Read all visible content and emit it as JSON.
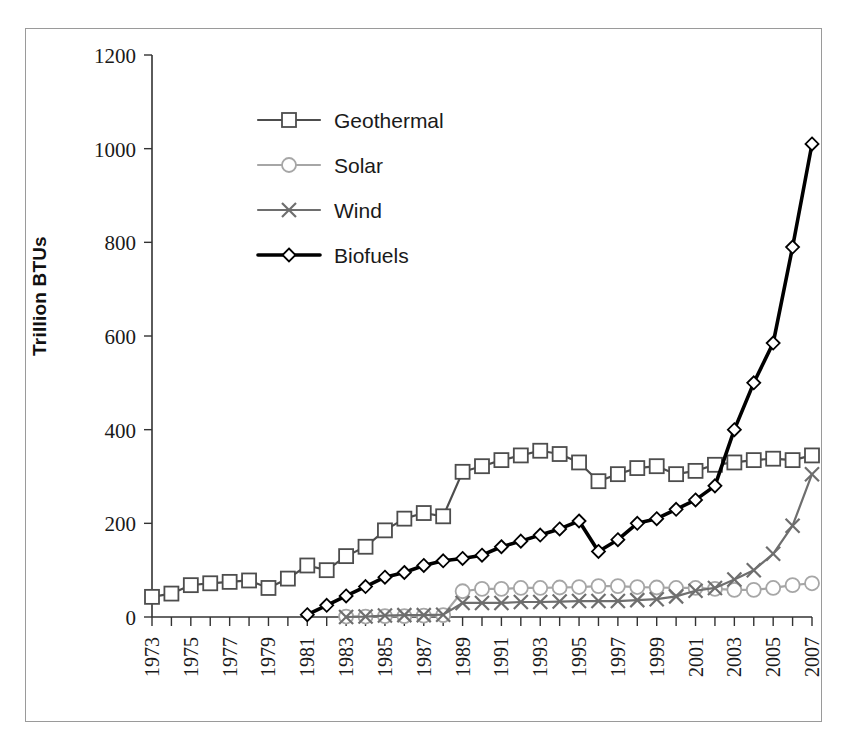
{
  "chart_data": {
    "type": "line",
    "title": "",
    "subtitle": "",
    "xlabel": "",
    "ylabel": "Trillion BTUs",
    "xlim": [
      1973,
      2007
    ],
    "ylim": [
      0,
      1200
    ],
    "ytick_step": 200,
    "yticks": [
      "0",
      "200",
      "400",
      "600",
      "800",
      "1000",
      "1200"
    ],
    "grid": false,
    "legend_position": "upper-left-inside",
    "x": [
      1973,
      1974,
      1975,
      1976,
      1977,
      1978,
      1979,
      1980,
      1981,
      1982,
      1983,
      1984,
      1985,
      1986,
      1987,
      1988,
      1989,
      1990,
      1991,
      1992,
      1993,
      1994,
      1995,
      1996,
      1997,
      1998,
      1999,
      2000,
      2001,
      2002,
      2003,
      2004,
      2005,
      2006,
      2007
    ],
    "xticklabels": [
      "1973",
      "",
      "1975",
      "",
      "1977",
      "",
      "1979",
      "",
      "1981",
      "",
      "1983",
      "",
      "1985",
      "",
      "1987",
      "",
      "1989",
      "",
      "1991",
      "",
      "1993",
      "",
      "1995",
      "",
      "1997",
      "",
      "1999",
      "",
      "2001",
      "",
      "2003",
      "",
      "2005",
      "",
      "2007"
    ],
    "series": [
      {
        "name": "Geothermal",
        "color": "#4d4d4d",
        "marker": "square",
        "line_width": 2.2,
        "values": [
          43,
          50,
          68,
          72,
          75,
          78,
          62,
          82,
          110,
          100,
          130,
          150,
          185,
          210,
          222,
          215,
          310,
          322,
          335,
          345,
          355,
          348,
          330,
          290,
          305,
          318,
          322,
          305,
          312,
          325,
          330,
          335,
          338,
          335,
          345
        ]
      },
      {
        "name": "Solar",
        "color": "#a6a6a6",
        "marker": "circle",
        "line_width": 2.2,
        "values": [
          null,
          null,
          null,
          null,
          null,
          null,
          null,
          null,
          null,
          null,
          1,
          1,
          2,
          2,
          3,
          4,
          55,
          60,
          60,
          62,
          62,
          63,
          64,
          66,
          66,
          64,
          63,
          62,
          62,
          60,
          58,
          58,
          62,
          68,
          72
        ]
      },
      {
        "name": "Wind",
        "color": "#6e6e6e",
        "marker": "x",
        "line_width": 2.2,
        "values": [
          null,
          null,
          null,
          null,
          null,
          null,
          null,
          null,
          null,
          null,
          0,
          1,
          3,
          4,
          4,
          5,
          30,
          30,
          30,
          32,
          32,
          33,
          34,
          34,
          34,
          36,
          38,
          44,
          56,
          62,
          80,
          100,
          135,
          195,
          305
        ]
      },
      {
        "name": "Biofuels",
        "color": "#000000",
        "marker": "diamond",
        "line_width": 3.6,
        "values": [
          null,
          null,
          null,
          null,
          null,
          null,
          null,
          null,
          5,
          25,
          45,
          65,
          85,
          95,
          110,
          120,
          125,
          132,
          150,
          162,
          175,
          188,
          205,
          140,
          165,
          200,
          210,
          230,
          250,
          280,
          400,
          500,
          585,
          790,
          1010
        ]
      }
    ]
  },
  "legend": {
    "items": [
      {
        "label": "Geothermal"
      },
      {
        "label": "Solar"
      },
      {
        "label": "Wind"
      },
      {
        "label": "Biofuels"
      }
    ]
  },
  "axis": {
    "y_title": "Trillion BTUs"
  }
}
